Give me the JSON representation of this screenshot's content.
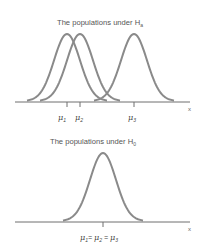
{
  "top_panel": {
    "title": "The populations under H",
    "title_subscript": "a",
    "axis_label": "x",
    "curves": [
      {
        "name": "population-1",
        "mean_label": "μ",
        "mean_subscript": "1",
        "center_x": 67
      },
      {
        "name": "population-2",
        "mean_label": "μ",
        "mean_subscript": "2",
        "center_x": 80
      },
      {
        "name": "population-3",
        "mean_label": "μ",
        "mean_subscript": "3",
        "center_x": 134
      }
    ]
  },
  "bottom_panel": {
    "title": "The populations under H",
    "title_subscript": "0",
    "axis_label": "x",
    "mean_label_parts": [
      "μ",
      "1",
      "= ",
      "μ",
      "2",
      " = ",
      "μ",
      "3"
    ],
    "curve": {
      "name": "common-population",
      "center_x": 103
    }
  },
  "colors": {
    "curve": "#8a8a8a",
    "axis": "#6e6e6e",
    "text": "#555555"
  }
}
